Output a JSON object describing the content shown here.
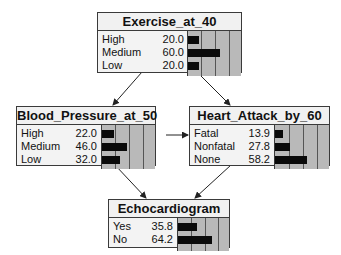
{
  "nodes": [
    {
      "id": "exercise",
      "title": "Exercise_at_40",
      "states": [
        {
          "label": "High",
          "value": "20.0",
          "pct": 20.0
        },
        {
          "label": "Medium",
          "value": "60.0",
          "pct": 60.0
        },
        {
          "label": "Low",
          "value": "20.0",
          "pct": 20.0
        }
      ]
    },
    {
      "id": "bp",
      "title": "Blood_Pressure_at_50",
      "states": [
        {
          "label": "High",
          "value": "22.0",
          "pct": 22.0
        },
        {
          "label": "Medium",
          "value": "46.0",
          "pct": 46.0
        },
        {
          "label": "Low",
          "value": "32.0",
          "pct": 32.0
        }
      ]
    },
    {
      "id": "ha",
      "title": "Heart_Attack_by_60",
      "states": [
        {
          "label": "Fatal",
          "value": "13.9",
          "pct": 13.9
        },
        {
          "label": "Nonfatal",
          "value": "27.8",
          "pct": 27.8
        },
        {
          "label": "None",
          "value": "58.2",
          "pct": 58.2
        }
      ]
    },
    {
      "id": "echo",
      "title": "Echocardiogram",
      "states": [
        {
          "label": "Yes",
          "value": "35.8",
          "pct": 35.8
        },
        {
          "label": "No",
          "value": "64.2",
          "pct": 64.2
        }
      ]
    }
  ],
  "edges": [
    {
      "from": "Exercise_at_40",
      "to": "Blood_Pressure_at_50"
    },
    {
      "from": "Exercise_at_40",
      "to": "Heart_Attack_by_60"
    },
    {
      "from": "Blood_Pressure_at_50",
      "to": "Heart_Attack_by_60"
    },
    {
      "from": "Blood_Pressure_at_50",
      "to": "Echocardiogram"
    },
    {
      "from": "Heart_Attack_by_60",
      "to": "Echocardiogram"
    }
  ]
}
